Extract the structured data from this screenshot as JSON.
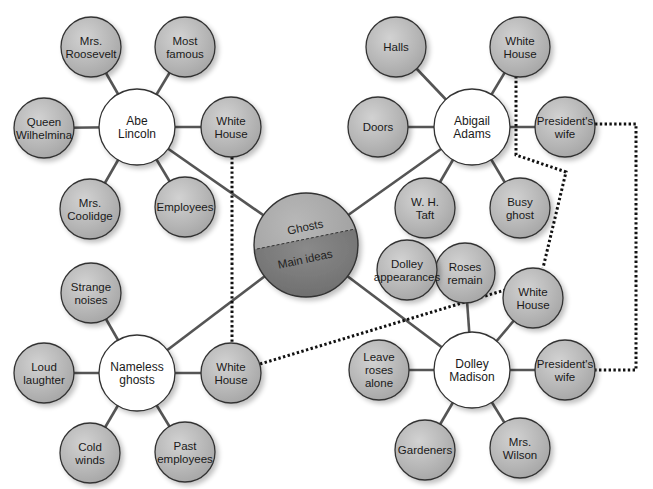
{
  "diagram": {
    "type": "concept-map",
    "center": {
      "id": "main",
      "top_label": "Ghosts",
      "bottom_label": "Main ideas",
      "x": 306,
      "y": 245,
      "r": 52
    },
    "colors": {
      "background": "#ffffff",
      "hub_fill": "#ffffff",
      "satellite_fill": "#b4b4b4",
      "satellite_highlight": "#cfcfcf",
      "center_top_fill": "#a8a8a8",
      "center_bottom_fill": "#7c7c7c",
      "stroke": "#333333",
      "connector": "#555555",
      "dotted": "#111111"
    },
    "hubs": [
      {
        "id": "abe",
        "label_lines": [
          "Abe",
          "Lincoln"
        ],
        "x": 137,
        "y": 127,
        "r": 38,
        "satellites": [
          {
            "label_lines": [
              "Mrs.",
              "Roosevelt"
            ],
            "x": 91,
            "y": 47
          },
          {
            "label_lines": [
              "Most",
              "famous"
            ],
            "x": 185,
            "y": 47
          },
          {
            "label_lines": [
              "Queen",
              "Wilhelmina"
            ],
            "x": 44,
            "y": 128
          },
          {
            "label_lines": [
              "White",
              "House"
            ],
            "x": 231,
            "y": 127
          },
          {
            "label_lines": [
              "Mrs.",
              "Coolidge"
            ],
            "x": 90,
            "y": 209
          },
          {
            "label_lines": [
              "Employees"
            ],
            "x": 185,
            "y": 207
          }
        ]
      },
      {
        "id": "abigail",
        "label_lines": [
          "Abigail",
          "Adams"
        ],
        "x": 472,
        "y": 127,
        "r": 38,
        "satellites": [
          {
            "label_lines": [
              "Halls"
            ],
            "x": 396,
            "y": 47
          },
          {
            "label_lines": [
              "White",
              "House"
            ],
            "x": 520,
            "y": 47
          },
          {
            "label_lines": [
              "Doors"
            ],
            "x": 378,
            "y": 127
          },
          {
            "label_lines": [
              "President's",
              "wife"
            ],
            "x": 565,
            "y": 127
          },
          {
            "label_lines": [
              "W. H.",
              "Taft"
            ],
            "x": 425,
            "y": 208
          },
          {
            "label_lines": [
              "Busy",
              "ghost"
            ],
            "x": 520,
            "y": 208
          }
        ]
      },
      {
        "id": "nameless",
        "label_lines": [
          "Nameless",
          "ghosts"
        ],
        "x": 137,
        "y": 373,
        "r": 38,
        "satellites": [
          {
            "label_lines": [
              "Strange",
              "noises"
            ],
            "x": 91,
            "y": 293
          },
          {
            "label_lines": [
              "Loud",
              "laughter"
            ],
            "x": 44,
            "y": 373
          },
          {
            "label_lines": [
              "White",
              "House"
            ],
            "x": 231,
            "y": 373
          },
          {
            "label_lines": [
              "Cold",
              "winds"
            ],
            "x": 90,
            "y": 453
          },
          {
            "label_lines": [
              "Past",
              "employees"
            ],
            "x": 185,
            "y": 452
          }
        ]
      },
      {
        "id": "dolley",
        "label_lines": [
          "Dolley",
          "Madison"
        ],
        "x": 472,
        "y": 370,
        "r": 38,
        "satellites": [
          {
            "label_lines": [
              "Roses",
              "remain"
            ],
            "x": 465,
            "y": 273
          },
          {
            "label_lines": [
              "White",
              "House"
            ],
            "x": 533,
            "y": 298
          },
          {
            "label_lines": [
              "Leave",
              "roses",
              "alone"
            ],
            "x": 379,
            "y": 370
          },
          {
            "label_lines": [
              "President's",
              "wife"
            ],
            "x": 565,
            "y": 370
          },
          {
            "label_lines": [
              "Gardeners"
            ],
            "x": 425,
            "y": 450
          },
          {
            "label_lines": [
              "Mrs.",
              "Wilson"
            ],
            "x": 520,
            "y": 448
          }
        ]
      }
    ],
    "extra_nodes": [
      {
        "id": "dolley-appearances",
        "label_lines": [
          "Dolley",
          "appearances"
        ],
        "x": 407,
        "y": 270,
        "attached_to": "roses-remain"
      }
    ],
    "satellite_radius": 30,
    "dotted_links": [
      {
        "name": "abe-wh-to-nameless-wh",
        "points": [
          [
            232,
            157
          ],
          [
            232,
            343
          ]
        ]
      },
      {
        "name": "nameless-wh-to-dolley-wh",
        "points": [
          [
            260,
            364
          ],
          [
            505,
            290
          ]
        ]
      },
      {
        "name": "abigail-wh-to-dolley-wh",
        "points": [
          [
            516,
            76
          ],
          [
            516,
            155
          ],
          [
            566,
            172
          ],
          [
            543,
            268
          ]
        ]
      },
      {
        "name": "abigail-wife-to-dolley-wife",
        "points": [
          [
            595,
            124
          ],
          [
            636,
            124
          ],
          [
            636,
            370
          ],
          [
            595,
            370
          ]
        ]
      }
    ]
  }
}
